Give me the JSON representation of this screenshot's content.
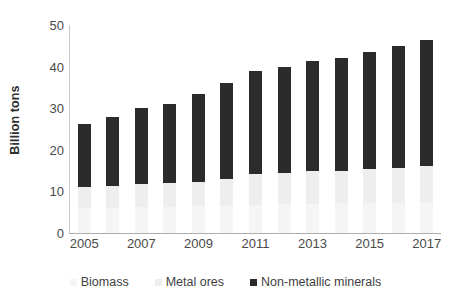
{
  "chart_data": {
    "type": "bar",
    "subtype": "stacked-bar",
    "title": "",
    "xlabel": "",
    "ylabel": "Billion tons",
    "ylim": [
      0,
      50
    ],
    "yticks": [
      0,
      10,
      20,
      30,
      40,
      50
    ],
    "grid": false,
    "legend_position": "bottom",
    "categories": [
      "2005",
      "2006",
      "2007",
      "2008",
      "2009",
      "2010",
      "2011",
      "2012",
      "2013",
      "2014",
      "2015",
      "2016",
      "2017"
    ],
    "visible_xtick_labels": [
      "2005",
      "2007",
      "2009",
      "2011",
      "2013",
      "2015",
      "2017"
    ],
    "series": [
      {
        "name": "Biomass",
        "color": "#f5f5f5",
        "values": [
          6.0,
          6.1,
          6.3,
          6.3,
          6.4,
          6.6,
          6.8,
          6.9,
          7.0,
          7.1,
          7.2,
          7.3,
          7.5
        ]
      },
      {
        "name": "Metal ores",
        "color": "#eeeeee",
        "values": [
          5.0,
          5.1,
          5.5,
          5.8,
          5.9,
          6.3,
          7.3,
          7.5,
          7.8,
          7.8,
          8.1,
          8.3,
          8.6
        ]
      },
      {
        "name": "Non-metallic minerals",
        "color": "#2b2b2b",
        "values": [
          15.3,
          16.8,
          18.2,
          18.9,
          21.0,
          23.1,
          24.9,
          25.6,
          26.6,
          27.1,
          28.2,
          29.4,
          30.4
        ]
      }
    ],
    "totals": [
      26.3,
      28.0,
      30.0,
      31.0,
      33.3,
      36.0,
      39.0,
      40.0,
      41.4,
      42.0,
      43.5,
      45.0,
      46.5
    ]
  },
  "axes": {
    "y_title": "Billion tons",
    "y_tick_labels": [
      "50",
      "40",
      "30",
      "20",
      "10",
      "0"
    ],
    "x_tick_labels": [
      "2005",
      "2007",
      "2009",
      "2011",
      "2013",
      "2015",
      "2017"
    ]
  },
  "legend": {
    "items": [
      {
        "label": "Biomass",
        "color": "#f5f5f5",
        "icon": "square-swatch-icon"
      },
      {
        "label": "Metal ores",
        "color": "#eeeeee",
        "icon": "square-swatch-icon"
      },
      {
        "label": "Non-metallic minerals",
        "color": "#2b2b2b",
        "icon": "square-swatch-icon"
      }
    ]
  }
}
